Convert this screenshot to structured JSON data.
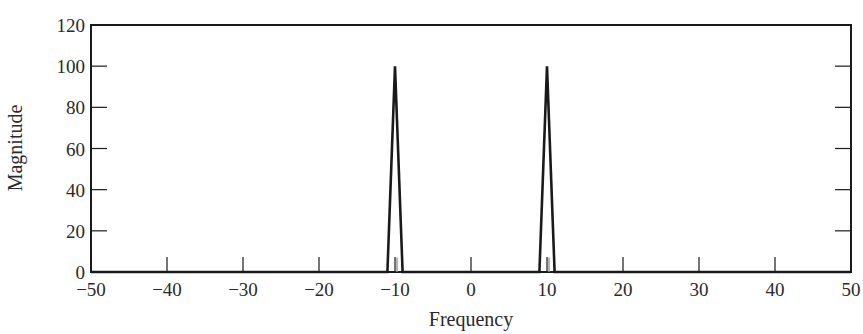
{
  "chart_data": {
    "type": "line",
    "title": "",
    "xlabel": "Frequency",
    "ylabel": "Magnitude",
    "xlim": [
      -50,
      50
    ],
    "ylim": [
      0,
      120
    ],
    "x_ticks": [
      -50,
      -40,
      -30,
      -20,
      -10,
      0,
      10,
      20,
      30,
      40,
      50
    ],
    "x_tick_labels": [
      "−50",
      "−40",
      "−30",
      "−20",
      "−10",
      "0",
      "10",
      "20",
      "30",
      "40",
      "50"
    ],
    "y_ticks": [
      0,
      20,
      40,
      60,
      80,
      100,
      120
    ],
    "y_tick_labels": [
      "0",
      "20",
      "40",
      "60",
      "80",
      "100",
      "120"
    ],
    "grid": false,
    "legend": null,
    "series": [
      {
        "name": "Magnitude spectrum",
        "color": "#1a1a1a",
        "x": [
          -50,
          -11,
          -10,
          -9,
          9,
          10,
          11,
          50
        ],
        "y": [
          0,
          0,
          100,
          0,
          0,
          100,
          0,
          0
        ]
      },
      {
        "name": "Inner residual",
        "color": "#9a9a9a",
        "x": [
          -10,
          -10,
          10,
          10
        ],
        "y": [
          0,
          7,
          0,
          7
        ]
      }
    ],
    "peaks": [
      {
        "frequency": -10,
        "magnitude": 100
      },
      {
        "frequency": 10,
        "magnitude": 100
      }
    ]
  },
  "labels": {
    "xlabel": "Frequency",
    "ylabel": "Magnitude"
  }
}
